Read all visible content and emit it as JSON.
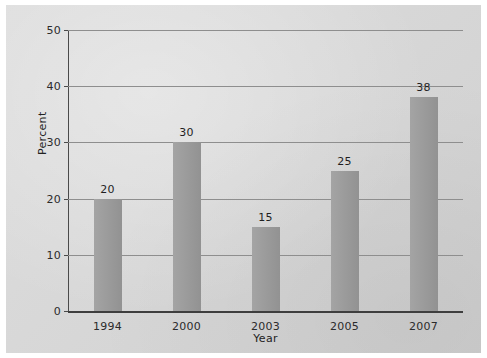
{
  "chart_data": {
    "type": "bar",
    "title": "",
    "xlabel": "Year",
    "ylabel": "Percent",
    "categories": [
      "1994",
      "2000",
      "2003",
      "2005",
      "2007"
    ],
    "values": [
      20,
      30,
      15,
      25,
      38
    ],
    "value_labels": [
      "20",
      "30",
      "15",
      "25",
      "38"
    ],
    "ylim": [
      0,
      50
    ],
    "yticks": [
      0,
      10,
      20,
      30,
      40,
      50
    ],
    "ytick_labels": [
      "0",
      "10",
      "20",
      "30",
      "40",
      "50"
    ],
    "grid": "horizontal",
    "legend": "none",
    "bar_color": "#9b9b9b",
    "gridline_color": "#8e8e8e",
    "axis_color": "#3e3e3e",
    "background_color": "#d6d6d6",
    "text_color": "#222222"
  }
}
